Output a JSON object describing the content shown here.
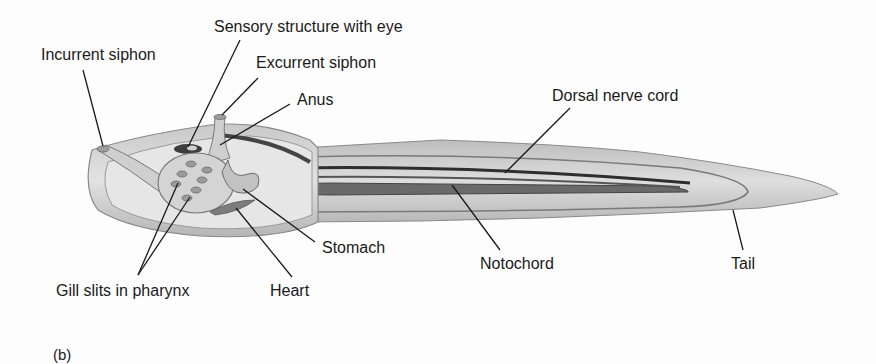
{
  "figure": {
    "panel_label": "(b)",
    "labels": {
      "sensory": "Sensory structure with eye",
      "incurrent": "Incurrent siphon",
      "excurrent": "Excurrent siphon",
      "anus": "Anus",
      "dorsal_nerve_cord": "Dorsal nerve cord",
      "stomach": "Stomach",
      "notochord": "Notochord",
      "tail": "Tail",
      "gill_slits": "Gill slits in pharynx",
      "heart": "Heart"
    }
  }
}
